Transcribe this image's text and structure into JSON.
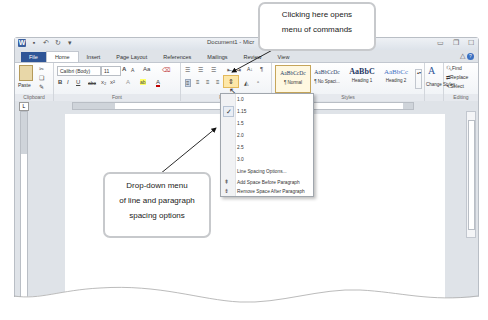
{
  "window": {
    "title": "Document1 - Micr",
    "quick_access": [
      "word-logo",
      "save",
      "undo",
      "redo",
      "customize"
    ],
    "controls": [
      "minimize",
      "restore",
      "close"
    ]
  },
  "tabs": [
    {
      "label": "File",
      "type": "file"
    },
    {
      "label": "Home",
      "active": true
    },
    {
      "label": "Insert"
    },
    {
      "label": "Page Layout"
    },
    {
      "label": "References"
    },
    {
      "label": "Mailings"
    },
    {
      "label": "Review"
    },
    {
      "label": "View"
    }
  ],
  "ribbon": {
    "clipboard": {
      "label": "Clipboard",
      "paste": "Paste"
    },
    "font": {
      "label": "Font",
      "font_name": "Calibri (Body)",
      "font_size": "11",
      "grow": "A",
      "shrink": "A",
      "case": "Aa",
      "bold": "B",
      "italic": "I",
      "underline": "U",
      "strike": "abc",
      "subscript": "x₂",
      "superscript": "x²",
      "highlight": "ab",
      "font_color": "A"
    },
    "paragraph": {
      "label": "Parag",
      "sort": "A↓",
      "pilcrow": "¶"
    },
    "styles": {
      "label": "Styles",
      "items": [
        {
          "sample": "AaBbCcDc",
          "name": "¶ Normal"
        },
        {
          "sample": "AaBbCcDc",
          "name": "¶ No Spaci..."
        },
        {
          "sample": "AaBbC",
          "name": "Heading 1"
        },
        {
          "sample": "AaBbCc",
          "name": "Heading 2"
        }
      ],
      "change_styles": "Change Styles"
    },
    "editing": {
      "label": "Editing",
      "find": "Find",
      "replace": "Replace",
      "select": "Select"
    }
  },
  "line_spacing_menu": {
    "options": [
      "1.0",
      "1.15",
      "1.5",
      "2.0",
      "2.5",
      "3.0"
    ],
    "selected": "1.15",
    "more": "Line Spacing Options...",
    "add_before": "Add Space Before Paragraph",
    "remove_after": "Remove Space After Paragraph"
  },
  "callouts": {
    "top": [
      "Clicking here opens",
      "menu of commands"
    ],
    "left": [
      "Drop-down menu",
      "of line and paragraph",
      "spacing options"
    ]
  },
  "colors": {
    "file_tab": "#2f5597",
    "highlight": "#fde7a8",
    "callout_border": "#c7c9cc"
  }
}
